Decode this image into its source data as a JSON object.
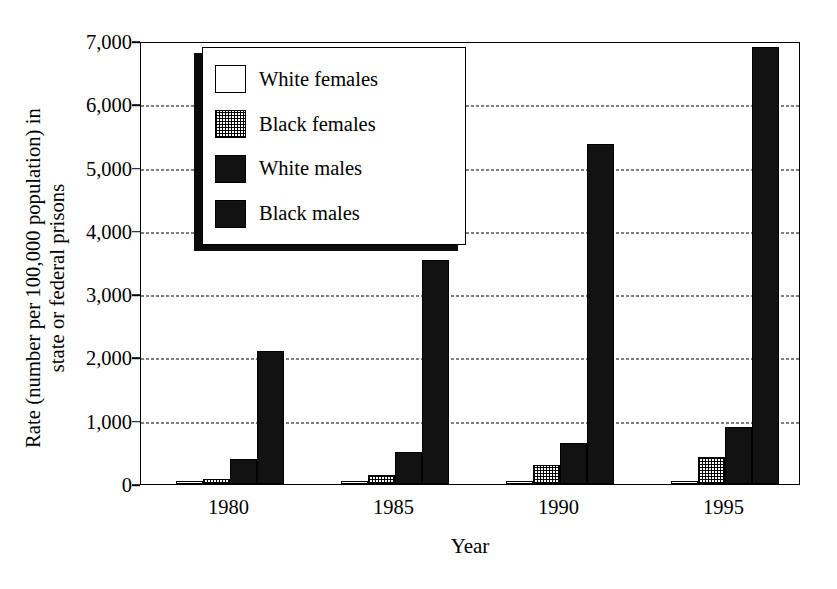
{
  "chart_data": {
    "type": "bar",
    "title": "",
    "xlabel": "Year",
    "ylabel": "Rate (number per 100,000 population) in state or federal prisons",
    "ylabel_lines": [
      "Rate (number per 100,000 population) in",
      "state or federal prisons"
    ],
    "categories": [
      "1980",
      "1985",
      "1990",
      "1995"
    ],
    "series": [
      {
        "name": "White females",
        "values": [
          10,
          20,
          30,
          45
        ],
        "fill": "white"
      },
      {
        "name": "Black females",
        "values": [
          85,
          150,
          300,
          420
        ],
        "fill": "checker"
      },
      {
        "name": "White males",
        "values": [
          400,
          510,
          650,
          900
        ],
        "fill": "black"
      },
      {
        "name": "Black males",
        "values": [
          2100,
          3540,
          5370,
          6900
        ],
        "fill": "black"
      }
    ],
    "ylim": [
      0,
      7000
    ],
    "yticks": [
      0,
      1000,
      2000,
      3000,
      4000,
      5000,
      6000,
      7000
    ],
    "ytick_labels": [
      "0",
      "1,000",
      "2,000",
      "3,000",
      "4,000",
      "5,000",
      "6,000",
      "7,000"
    ],
    "grid": true,
    "grid_style": "dashed",
    "legend_position": "upper-left-inside",
    "legend_entries": [
      "White females",
      "Black females",
      "White males",
      "Black males"
    ],
    "colors": {
      "line": "#000000",
      "background": "#ffffff",
      "bar_dark": "#121212"
    }
  }
}
